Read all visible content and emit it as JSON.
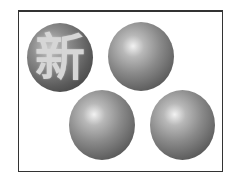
{
  "figure": {
    "spheres": [
      {
        "id": 1,
        "label": "新",
        "style": "textured-with-character"
      },
      {
        "id": 2,
        "label": "",
        "style": "plain-gradient"
      },
      {
        "id": 3,
        "label": "",
        "style": "plain-gradient"
      },
      {
        "id": 4,
        "label": "",
        "style": "plain-gradient"
      }
    ],
    "colors": {
      "border": "#333333",
      "sphere_highlight": "#f2f2f2",
      "sphere_shadow": "#3c3c3c",
      "glyph": "#d6d6d6"
    }
  }
}
